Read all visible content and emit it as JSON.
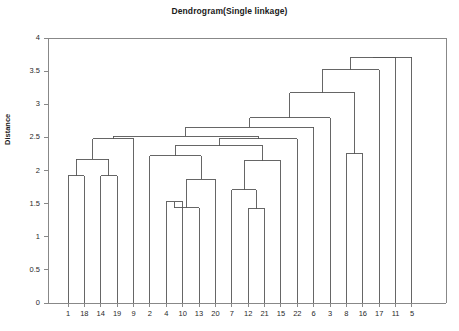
{
  "chart_data": {
    "type": "line",
    "title": "Dendrogram(Single linkage)",
    "xlabel": "",
    "ylabel": "Distance",
    "ylim": [
      0,
      4
    ],
    "yticks": [
      "0",
      "0.5",
      "1",
      "1.5",
      "2",
      "2.5",
      "3",
      "3.5",
      "4"
    ],
    "ytick_values": [
      0,
      0.5,
      1,
      1.5,
      2,
      2.5,
      3,
      3.5,
      4
    ],
    "grid": false,
    "legend": "none",
    "leaf_order": [
      "1",
      "18",
      "14",
      "19",
      "9",
      "2",
      "4",
      "10",
      "13",
      "20",
      "7",
      "12",
      "21",
      "15",
      "22",
      "6",
      "3",
      "8",
      "16",
      "17",
      "11",
      "5"
    ],
    "merges": [
      {
        "id": "m1",
        "left": "1",
        "right": "18",
        "height": 1.92
      },
      {
        "id": "m2",
        "left": "14",
        "right": "19",
        "height": 1.92
      },
      {
        "id": "m3",
        "left": "m1",
        "right": "m2",
        "height": 2.17
      },
      {
        "id": "m4",
        "left": "m3",
        "right": "9",
        "height": 2.48
      },
      {
        "id": "m5",
        "left": "4",
        "right": "10",
        "height": 1.53
      },
      {
        "id": "m6",
        "left": "m5",
        "right": "13",
        "height": 1.44
      },
      {
        "id": "m7",
        "left": "m6",
        "right": "20",
        "height": 1.87
      },
      {
        "id": "m8",
        "left": "2",
        "right": "m7",
        "height": 2.22
      },
      {
        "id": "m9",
        "left": "12",
        "right": "21",
        "height": 1.42
      },
      {
        "id": "m10",
        "left": "7",
        "right": "m9",
        "height": 1.71
      },
      {
        "id": "m11",
        "left": "m10",
        "right": "15",
        "height": 2.15
      },
      {
        "id": "m12",
        "left": "m8",
        "right": "m11",
        "height": 2.37
      },
      {
        "id": "m13",
        "left": "m12",
        "right": "22",
        "height": 2.48
      },
      {
        "id": "m14",
        "left": "m4",
        "right": "m13",
        "height": 2.52
      },
      {
        "id": "m15",
        "left": "m14",
        "right": "6",
        "height": 2.65
      },
      {
        "id": "m16",
        "left": "m15",
        "right": "3",
        "height": 2.8
      },
      {
        "id": "m17",
        "left": "8",
        "right": "16",
        "height": 2.25
      },
      {
        "id": "m18",
        "left": "m16",
        "right": "m17",
        "height": 3.17
      },
      {
        "id": "m19",
        "left": "m18",
        "right": "17",
        "height": 3.52
      },
      {
        "id": "m20",
        "left": "m19",
        "right": "11",
        "height": 3.71
      },
      {
        "id": "m21",
        "left": "m20",
        "right": "5",
        "height": 3.71
      }
    ],
    "line_color": "#555555",
    "axis_color": "#888888",
    "text_color": "#1a1a1a"
  },
  "plot_geometry": {
    "left": 48,
    "right": 446,
    "top": 38,
    "bottom": 303,
    "leaf_start": 68,
    "leaf_spacing": 16.38
  }
}
